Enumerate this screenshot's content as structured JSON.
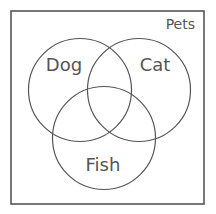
{
  "diagram": {
    "type": "venn",
    "universe": {
      "label": "Pets",
      "rect": {
        "x": 11,
        "y": 11,
        "width": 193,
        "height": 193
      }
    },
    "sets": [
      {
        "id": "dog",
        "label": "Dog",
        "cx": 80,
        "cy": 90,
        "r": 51.5,
        "label_x": 64,
        "label_y": 71
      },
      {
        "id": "cat",
        "label": "Cat",
        "cx": 139,
        "cy": 90,
        "r": 51.5,
        "label_x": 155,
        "label_y": 71
      },
      {
        "id": "fish",
        "label": "Fish",
        "cx": 104,
        "cy": 138,
        "r": 51.5,
        "label_x": 103,
        "label_y": 171
      }
    ],
    "colors": {
      "stroke": "#555555",
      "text": "#555555",
      "background": "#ffffff"
    }
  }
}
